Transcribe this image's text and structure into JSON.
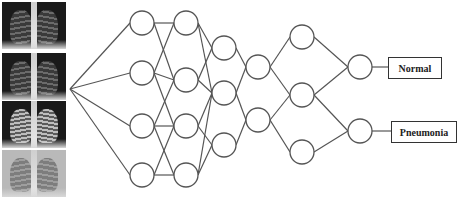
{
  "diagram": {
    "input_images": [
      {
        "name": "chest-xray-1",
        "style": ""
      },
      {
        "name": "chest-xray-2",
        "style": ""
      },
      {
        "name": "chest-xray-3",
        "style": "hazy"
      },
      {
        "name": "chest-xray-4",
        "style": "pale"
      }
    ],
    "layers": [
      {
        "x": 142,
        "nodes": [
          23,
          73,
          126,
          175
        ]
      },
      {
        "x": 186,
        "nodes": [
          23,
          80,
          126,
          175
        ]
      },
      {
        "x": 224,
        "nodes": [
          48,
          93,
          145
        ]
      },
      {
        "x": 258,
        "nodes": [
          67,
          120
        ]
      },
      {
        "x": 302,
        "nodes": [
          37,
          95,
          152
        ]
      },
      {
        "x": 360,
        "nodes": [
          67,
          131
        ]
      }
    ],
    "node_radius": 12,
    "input_hub": {
      "x": 70,
      "y": 89
    },
    "outputs": [
      {
        "label": "Normal",
        "x": 388,
        "y": 57,
        "w": 52,
        "h": 20
      },
      {
        "label": "Pneumonia",
        "x": 391,
        "y": 121,
        "w": 64,
        "h": 20
      }
    ],
    "stroke_color": "#555555"
  }
}
